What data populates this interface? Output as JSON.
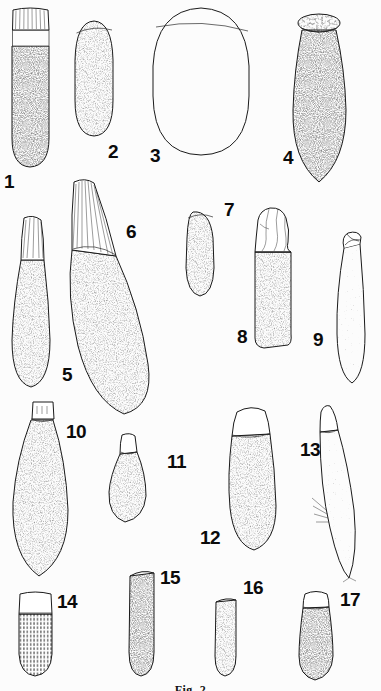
{
  "plate": {
    "title": "Plate of numbered specimen illustrations",
    "width": 381,
    "height": 691,
    "background_color": "#fcfcfc",
    "ink_color": "#1a1a1a",
    "style": "stippled pen-and-ink scientific illustration",
    "caption": "Fig. 2",
    "caption_note": "caption is clipped by the bottom edge of the image"
  },
  "specimens": [
    {
      "number": "1",
      "label": "1",
      "shape": "elongate cylinder with rounded base and striated collar near the top",
      "texture": "dense stipple on body, pale banded collar with fine vertical lines",
      "cap": "striated ribbed neck",
      "label_x": 4,
      "label_y": 172,
      "x": 6,
      "y": 6,
      "w": 48,
      "h": 164
    },
    {
      "number": "2",
      "label": "2",
      "shape": "smooth ovoid, broadest near the middle",
      "texture": "even medium stipple",
      "cap": "narrow oblique rim at top",
      "label_x": 108,
      "label_y": 142,
      "x": 72,
      "y": 16,
      "w": 42,
      "h": 122
    },
    {
      "number": "3",
      "label": "3",
      "shape": "large rounded egg-shaped body, widest of the plate",
      "texture": "very light sparse stipple",
      "cap": "broad oblique opening across the top",
      "label_x": 150,
      "label_y": 146,
      "x": 148,
      "y": 4,
      "w": 104,
      "h": 152
    },
    {
      "number": "4",
      "label": "4",
      "shape": "elongate ovoid with a flat disc-like cap",
      "texture": "graded stipple, darker toward the base",
      "cap": "flat elliptical speckled cap",
      "label_x": 283,
      "label_y": 148,
      "x": 288,
      "y": 4,
      "w": 62,
      "h": 180
    },
    {
      "number": "5",
      "label": "5",
      "shape": "club-shaped, tapering upward to a striated tip",
      "texture": "medium stipple body",
      "cap": "pale striated conical tip",
      "label_x": 62,
      "label_y": 365,
      "x": 8,
      "y": 212,
      "w": 48,
      "h": 176
    },
    {
      "number": "6",
      "label": "6",
      "shape": "very large curved club, bending to the lower right",
      "texture": "dense stipple over a long curved body",
      "cap": "long striated tapering neck with many fine lines",
      "label_x": 126,
      "label_y": 222,
      "x": 62,
      "y": 180,
      "w": 112,
      "h": 236
    },
    {
      "number": "7",
      "label": "7",
      "shape": "small short ovoid, slightly tilted",
      "texture": "fine even stipple",
      "cap": "narrow oblique rim",
      "label_x": 224,
      "label_y": 200,
      "x": 182,
      "y": 206,
      "w": 36,
      "h": 92
    },
    {
      "number": "8",
      "label": "8",
      "shape": "cylindrical body with a lumpy irregular folded head",
      "texture": "medium stipple on shaft, smooth lobed head",
      "cap": "crumpled lobed apex",
      "label_x": 237,
      "label_y": 327,
      "x": 248,
      "y": 204,
      "w": 48,
      "h": 146
    },
    {
      "number": "9",
      "label": "9",
      "shape": "slender elongate tube, slightly curved",
      "texture": "light stipple",
      "cap": "open obliquely cut tube mouth",
      "label_x": 313,
      "label_y": 330,
      "x": 330,
      "y": 228,
      "w": 40,
      "h": 156
    },
    {
      "number": "10",
      "label": "10",
      "shape": "large pear-shaped body, broad rounded base",
      "texture": "even medium stipple",
      "cap": "small pale rectangular collar at the top",
      "label_x": 66,
      "label_y": 422,
      "x": 8,
      "y": 398,
      "w": 66,
      "h": 182
    },
    {
      "number": "11",
      "label": "11",
      "shape": "small teardrop, widest near the base",
      "texture": "fine stipple",
      "cap": "short pale neck",
      "label_x": 167,
      "label_y": 452,
      "x": 104,
      "y": 430,
      "w": 46,
      "h": 94
    },
    {
      "number": "12",
      "label": "12",
      "shape": "elongate club curved slightly to the right",
      "texture": "medium dense stipple",
      "cap": "pale smooth dome separated by a transverse line",
      "label_x": 200,
      "label_y": 528,
      "x": 224,
      "y": 402,
      "w": 56,
      "h": 150
    },
    {
      "number": "13",
      "label": "13",
      "shape": "slender tilted spindle with fine bristles along the lower left",
      "texture": "light stipple with hair-like projections",
      "cap": "pointed pale tip with a transverse line",
      "label_x": 300,
      "label_y": 440,
      "x": 312,
      "y": 402,
      "w": 52,
      "h": 178
    },
    {
      "number": "14",
      "label": "14",
      "shape": "short barrel-shaped body with a squared pale cap",
      "texture": "vertical ribbed dashed texture",
      "cap": "large pale rectangular cap",
      "label_x": 57,
      "label_y": 592,
      "x": 12,
      "y": 588,
      "w": 46,
      "h": 90
    },
    {
      "number": "15",
      "label": "15",
      "shape": "elongate rounded-rectangular body",
      "texture": "dense uniform stipple",
      "cap": "thin oblique dark rim",
      "label_x": 160,
      "label_y": 568,
      "x": 123,
      "y": 566,
      "w": 36,
      "h": 112
    },
    {
      "number": "16",
      "label": "16",
      "shape": "short stout cylinder with rounded base",
      "texture": "medium stipple",
      "cap": "thin dark oblique rim",
      "label_x": 243,
      "label_y": 578,
      "x": 210,
      "y": 594,
      "w": 30,
      "h": 84
    },
    {
      "number": "17",
      "label": "17",
      "shape": "elongate club widening downward",
      "texture": "dense stipple",
      "cap": "pale domed cap with a transverse line",
      "label_x": 340,
      "label_y": 590,
      "x": 294,
      "y": 586,
      "w": 44,
      "h": 96
    }
  ]
}
